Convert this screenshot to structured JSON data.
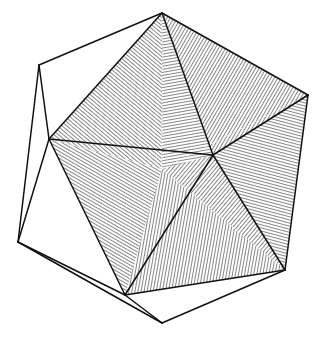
{
  "figure": {
    "caption": "",
    "stroke_color": "#111111",
    "hatch_color": "#222222",
    "background": "#ffffff",
    "vertices": {
      "top": [
        162,
        13
      ],
      "upper_left": [
        39,
        65
      ],
      "left_mid": [
        49,
        139
      ],
      "right": [
        308,
        95
      ],
      "inner_right": [
        213,
        155
      ],
      "center": [
        162,
        169
      ],
      "lower_left": [
        18,
        242
      ],
      "lower_right": [
        285,
        270
      ],
      "bottom_inner": [
        125,
        295
      ],
      "bottom": [
        162,
        323
      ]
    },
    "faces": [
      {
        "name": "face-top-left",
        "pts": [
          "top",
          "left_mid",
          "center"
        ],
        "hatch_angle": -50
      },
      {
        "name": "face-top-right",
        "pts": [
          "top",
          "right",
          "inner_right"
        ],
        "hatch_angle": 30
      },
      {
        "name": "face-top-mid",
        "pts": [
          "top",
          "inner_right",
          "center"
        ],
        "hatch_angle": 80
      },
      {
        "name": "face-left",
        "pts": [
          "left_mid",
          "center",
          "bottom_inner"
        ],
        "hatch_angle": -60
      },
      {
        "name": "face-right",
        "pts": [
          "right",
          "lower_right",
          "inner_right"
        ],
        "hatch_angle": -75
      },
      {
        "name": "face-center-right",
        "pts": [
          "center",
          "inner_right",
          "lower_right"
        ],
        "hatch_angle": 40
      },
      {
        "name": "face-bottom",
        "pts": [
          "center",
          "lower_right",
          "bottom_inner"
        ],
        "hatch_angle": 10
      }
    ],
    "solid_edges": [
      [
        "top",
        "upper_left"
      ],
      [
        "upper_left",
        "left_mid"
      ],
      [
        "upper_left",
        "lower_left"
      ],
      [
        "left_mid",
        "lower_left"
      ],
      [
        "lower_left",
        "bottom_inner"
      ],
      [
        "lower_left",
        "bottom"
      ],
      [
        "bottom_inner",
        "bottom"
      ],
      [
        "bottom",
        "lower_right"
      ],
      [
        "lower_right",
        "right"
      ],
      [
        "right",
        "top"
      ],
      [
        "top",
        "left_mid"
      ],
      [
        "top",
        "inner_right"
      ],
      [
        "left_mid",
        "inner_right"
      ],
      [
        "left_mid",
        "bottom_inner"
      ],
      [
        "inner_right",
        "lower_right"
      ],
      [
        "inner_right",
        "bottom_inner"
      ],
      [
        "right",
        "inner_right"
      ],
      [
        "bottom_inner",
        "lower_right"
      ]
    ],
    "hidden_edges": [
      [
        "top",
        "center"
      ],
      [
        "center",
        "left_mid"
      ],
      [
        "center",
        "right"
      ],
      [
        "center",
        "lower_right"
      ]
    ]
  }
}
